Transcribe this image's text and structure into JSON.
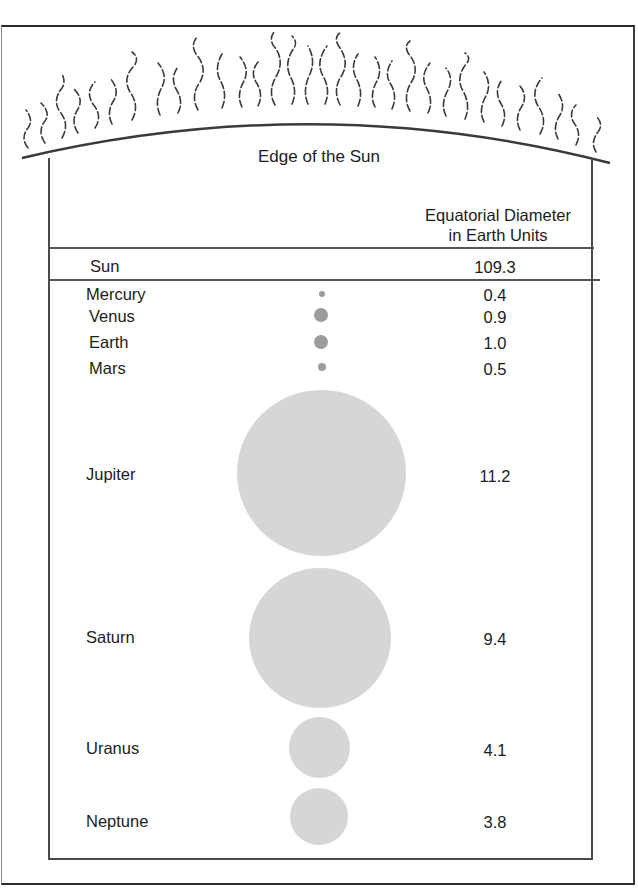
{
  "diagram": {
    "sun_edge_label": "Edge of the Sun",
    "column_header": {
      "line1": "Equatorial Diameter",
      "line2": "in Earth Units"
    },
    "sun_row": {
      "name": "Sun",
      "value": "109.3"
    },
    "planets": [
      {
        "name": "Mercury",
        "value": "0.4"
      },
      {
        "name": "Venus",
        "value": "0.9"
      },
      {
        "name": "Earth",
        "value": "1.0"
      },
      {
        "name": "Mars",
        "value": "0.5"
      },
      {
        "name": "Jupiter",
        "value": "11.2"
      },
      {
        "name": "Saturn",
        "value": "9.4"
      },
      {
        "name": "Uranus",
        "value": "4.1"
      },
      {
        "name": "Neptune",
        "value": "3.8"
      }
    ],
    "colors": {
      "line": "#4a4a4a",
      "small_planet_fill": "#9c9c9c",
      "large_planet_fill": "#d6d6d6"
    }
  }
}
